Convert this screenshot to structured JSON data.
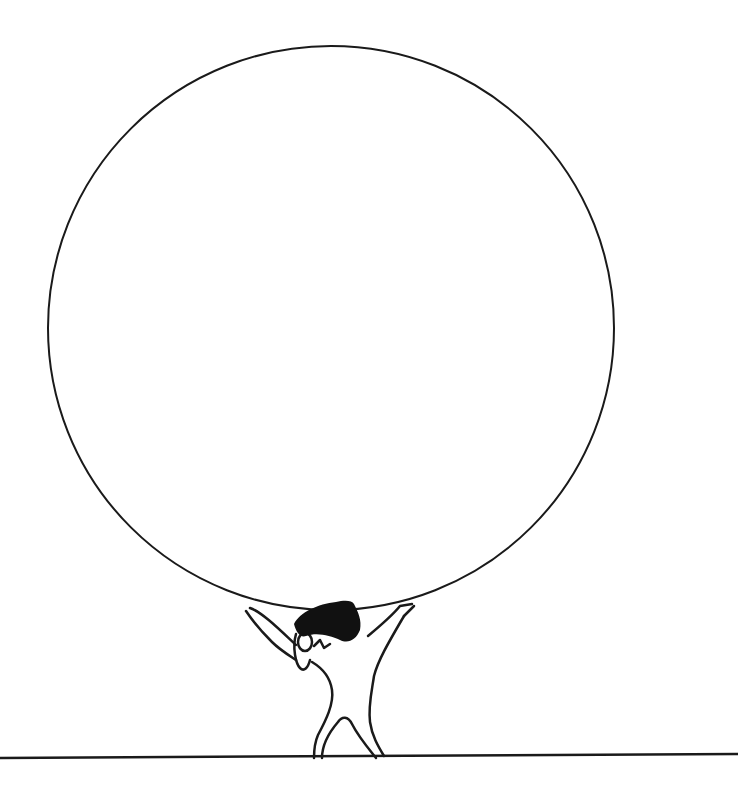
{
  "illustration": {
    "subject": "figure holding up a large circle",
    "colors": {
      "ink": "#1a1a1a",
      "background": "#ffffff"
    },
    "circle": {
      "cx": 331,
      "cy": 328,
      "rx": 283,
      "ry": 282
    },
    "ground_line": {
      "x1": 0,
      "y1": 758,
      "x2": 738,
      "y2": 754
    }
  },
  "caption": {
    "text": "",
    "note": "text partially cut off at bottom edge"
  }
}
